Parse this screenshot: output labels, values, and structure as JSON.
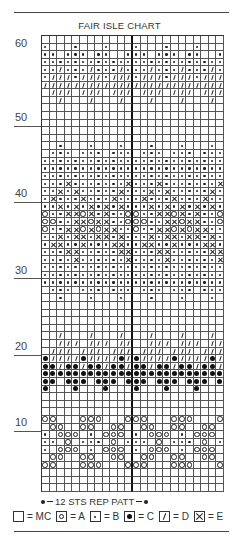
{
  "chart_data": {
    "type": "table",
    "title": "FAIR ISLE CHART",
    "repeat_note": "12 STS REP PATT",
    "columns": 24,
    "rows": 60,
    "stitches_per_repeat": 12,
    "row_labels": [
      60,
      50,
      40,
      30,
      20,
      10
    ],
    "legend": [
      {
        "key": ".",
        "symbol": "blank-square",
        "label": "MC"
      },
      {
        "key": "o",
        "symbol": "circle",
        "label": "A"
      },
      {
        "key": "b",
        "symbol": "small-dot",
        "label": "B"
      },
      {
        "key": "c",
        "symbol": "large-dot",
        "label": "C"
      },
      {
        "key": "d",
        "symbol": "slash",
        "label": "D"
      },
      {
        "key": "x",
        "symbol": "cross",
        "label": "E"
      }
    ],
    "encoding": "Each string is one row of the 12-stitch repeat, listed from row 60 (top) down to row 1 (bottom). Repeat is shown twice across 24 columns.",
    "pattern_rows": [
      "............",
      "b...b...b...",
      "bb.bbb.bb..b",
      "bbbbbbbbbbbb",
      "bbdbbbdbbbdb",
      "bdddbdddbddd",
      "dddddddddddd",
      ".ddd.ddd.ddd",
      "..d...d...d.",
      "............",
      "............",
      "............",
      "............",
      "............",
      "..b...b...b.",
      ".bbb.bbb.bbb",
      "bbbbbbbbbbbb",
      "bbbbbbbbbbbb",
      "bbbbbbbbbbbb",
      "bbbxbbbbbbbx",
      "bbxbxbbbbbxb",
      "bxbbbxbbbxbb",
      "bbxbxbxbxbxb",
      "obbxxoxbxbbo",
      "oobbxxoxxbbo",
      "obbxxoxoxxbb",
      "bbxbxxbxxbxb",
      "bxxbbxbbbxxb",
      "bbbxxbbbbbxx",
      "bbbbxbbbbbbx",
      "bbbbbbbbbbbb",
      "bbbbbbbbbbbb",
      "bbbbbbbbbbbb",
      ".bbb.bbb.bbb",
      "..b...b...b.",
      "............",
      "............",
      "............",
      "............",
      "..d...d...d.",
      "..ddd.ddd.dd",
      ".ddd.ddd.ddd",
      "cddddcddddcd",
      "ccdccdccdccd",
      "cccccccccccc",
      "cc.ccc.ccc.c",
      "c...c...c...",
      "............",
      "............",
      "............",
      "oo...ooo...o",
      ".oo..oo..oo.",
      "b.ooo.b.ooo.",
      "bb.o.bbb.o.b",
      "b.ooo.b.ooo.",
      ".oo..oo..oo.",
      "oo...ooo...o",
      "............",
      "............",
      "............"
    ]
  }
}
